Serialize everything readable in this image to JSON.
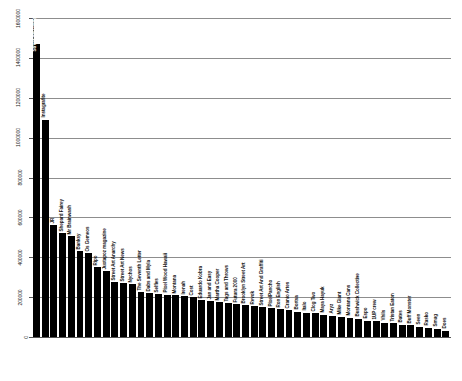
{
  "chart_data": {
    "type": "bar",
    "title": "",
    "subtitle": "",
    "xlabel": "",
    "ylabel": "",
    "grid": true,
    "legend": "none",
    "orientation": "vertical",
    "bar_color": "#000000",
    "gridline_color": "#8d8d8d",
    "axis_color": "#555555",
    "ylim": [
      0,
      1600000
    ],
    "ytick_step": 200000,
    "ytick_labels": [
      "0",
      "200000",
      "400000",
      "600000",
      "800000",
      "1000000",
      "1200000",
      "1400000",
      "1600000"
    ],
    "ytick_values": [
      0,
      200000,
      400000,
      600000,
      800000,
      1000000,
      1200000,
      1400000,
      1600000
    ],
    "categories": [
      "Street Art Globe",
      "Instagrafite",
      "JR",
      "Shepard Fairey",
      "Mr Brainwash",
      "Banksy",
      "Os Gemeos",
      "Ripo",
      "Juxtapoz magazine",
      "Street Art Anarchy",
      "Street Art News",
      "Nychos",
      "The Seventh Letter",
      "Dabs and Myla",
      "Selfies",
      "Pixel Wood Hawaii",
      "Montana",
      "Irenah",
      "Cost",
      "Eduardo Kobra",
      "Jan and Easy",
      "Martha Cooper",
      "Tags and Throws",
      "Futura 2000",
      "Brooklyn Street Art",
      "Revok",
      "Street Art And Graffiti",
      "PixelPancho",
      "Ron English",
      "Cranio Artes",
      "Bortsa",
      "Italo",
      "Clog Two",
      "Maya Hayuk",
      "Aryz",
      "Mike Giant",
      "Montana Cans",
      "Bushwick Collective",
      "Espo",
      "1UP crew",
      "Vhils",
      "Tristan Eaton",
      "Bates",
      "Buff Monster",
      "Seen",
      "Rasko",
      "Smug",
      "Does"
    ],
    "values": [
      1470000,
      1090000,
      560000,
      520000,
      505000,
      430000,
      420000,
      350000,
      330000,
      275000,
      270000,
      265000,
      225000,
      220000,
      215000,
      213000,
      210000,
      205000,
      200000,
      185000,
      180000,
      175000,
      170000,
      165000,
      160000,
      155000,
      150000,
      145000,
      140000,
      135000,
      125000,
      120000,
      118000,
      112000,
      105000,
      100000,
      95000,
      90000,
      82000,
      78000,
      72000,
      68000,
      62000,
      58000,
      50000,
      45000,
      40000,
      32000
    ]
  }
}
